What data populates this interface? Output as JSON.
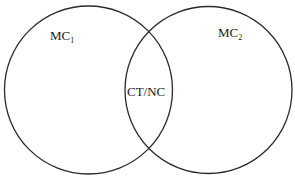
{
  "diagram": {
    "type": "venn",
    "sets": [
      {
        "label": "MC",
        "subscript": "1"
      },
      {
        "label": "MC",
        "subscript": "2"
      }
    ],
    "intersection": {
      "label": "CT/NC"
    }
  },
  "colors": {
    "stroke": "#2a2a2a",
    "text": "#1a1a1a",
    "background": "#ffffff"
  }
}
